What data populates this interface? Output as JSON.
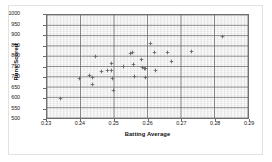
{
  "chart_data": {
    "type": "scatter",
    "title": "",
    "xlabel": "Batting Average",
    "ylabel": "Runs Scored",
    "xlim": [
      0.23,
      0.29
    ],
    "ylim": [
      500,
      1000
    ],
    "xticks": [
      0.23,
      0.24,
      0.25,
      0.26,
      0.27,
      0.28,
      0.29
    ],
    "xtick_labels": [
      "0.23",
      "0.24",
      "0.25",
      "0.26",
      "0.27",
      "0.28",
      "0.29"
    ],
    "yticks": [
      500,
      550,
      600,
      650,
      700,
      750,
      800,
      850,
      900,
      950,
      1000
    ],
    "ytick_labels": [
      "500",
      "550",
      "600",
      "650",
      "700",
      "750",
      "800",
      "850",
      "900",
      "950",
      "1000"
    ],
    "x_major_step": 0.01,
    "x_minor_step": 0.001,
    "y_major_step": 50,
    "y_minor_step": 10,
    "grid": true,
    "minor_grid": true,
    "legend": false,
    "marker": "diamond",
    "marker_color": "#666666",
    "series": [
      {
        "name": "Teams",
        "points": [
          [
            0.234,
            603
          ],
          [
            0.2395,
            697
          ],
          [
            0.2425,
            710
          ],
          [
            0.2435,
            703
          ],
          [
            0.2435,
            667
          ],
          [
            0.2443,
            801
          ],
          [
            0.2462,
            730
          ],
          [
            0.2478,
            737
          ],
          [
            0.2492,
            769
          ],
          [
            0.2492,
            737
          ],
          [
            0.2494,
            696
          ],
          [
            0.2497,
            640
          ],
          [
            0.2525,
            754
          ],
          [
            0.2548,
            818
          ],
          [
            0.2552,
            823
          ],
          [
            0.2556,
            763
          ],
          [
            0.2558,
            707
          ],
          [
            0.2578,
            790
          ],
          [
            0.2583,
            751
          ],
          [
            0.2588,
            747
          ],
          [
            0.2592,
            744
          ],
          [
            0.2592,
            703
          ],
          [
            0.2605,
            864
          ],
          [
            0.2617,
            820
          ],
          [
            0.2622,
            735
          ],
          [
            0.2655,
            820
          ],
          [
            0.2668,
            780
          ],
          [
            0.2728,
            827
          ],
          [
            0.2818,
            900
          ]
        ]
      }
    ]
  },
  "axes": {
    "x_title": "Batting Average",
    "y_title": "Runs Scored"
  }
}
